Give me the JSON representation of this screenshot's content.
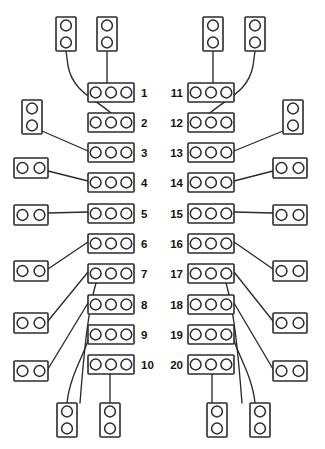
{
  "diagram": {
    "type": "connector-pinout",
    "canvas": {
      "width": 325,
      "height": 449
    },
    "colors": {
      "background": "#ffffff",
      "stroke": "#2b2b2b",
      "label": "#141414",
      "fill": "#ffffff"
    },
    "geometry": {
      "hole_radius": 5.4,
      "block_stroke_width": 1.6,
      "lead_stroke_width": 1.35,
      "row_pitch": 30.2,
      "first_row_top": 83,
      "block3_width": 46,
      "block3_height": 19,
      "block2h_width": 34,
      "block2h_height": 20,
      "block2v_width": 20,
      "block2v_height": 34
    },
    "columns": {
      "left": {
        "name": "left-terminal-column",
        "block_x": 88,
        "label_x": 141,
        "label_align": "start"
      },
      "right": {
        "name": "right-terminal-column",
        "block_x": 188,
        "label_x": 183,
        "label_align": "end"
      }
    },
    "terminal_rows": {
      "left": [
        {
          "label": "1",
          "y": 83
        },
        {
          "label": "2",
          "y": 113
        },
        {
          "label": "3",
          "y": 143
        },
        {
          "label": "4",
          "y": 173
        },
        {
          "label": "5",
          "y": 204
        },
        {
          "label": "6",
          "y": 234
        },
        {
          "label": "7",
          "y": 264
        },
        {
          "label": "8",
          "y": 295
        },
        {
          "label": "9",
          "y": 325
        },
        {
          "label": "10",
          "y": 355
        }
      ],
      "right": [
        {
          "label": "11",
          "y": 83
        },
        {
          "label": "12",
          "y": 113
        },
        {
          "label": "13",
          "y": 143
        },
        {
          "label": "14",
          "y": 173
        },
        {
          "label": "15",
          "y": 204
        },
        {
          "label": "16",
          "y": 234
        },
        {
          "label": "17",
          "y": 264
        },
        {
          "label": "18",
          "y": 295
        },
        {
          "label": "19",
          "y": 325
        },
        {
          "label": "20",
          "y": 355
        }
      ]
    },
    "connectors": [
      {
        "name": "connector-top-left-a",
        "shape": "2-vertical",
        "x": 56,
        "y": 17
      },
      {
        "name": "connector-top-left-b",
        "shape": "2-vertical",
        "x": 97,
        "y": 17
      },
      {
        "name": "connector-top-right-a",
        "shape": "2-vertical",
        "x": 203,
        "y": 17
      },
      {
        "name": "connector-top-right-b",
        "shape": "2-vertical",
        "x": 245,
        "y": 17
      },
      {
        "name": "connector-left-1",
        "shape": "2-vertical",
        "x": 22,
        "y": 100
      },
      {
        "name": "connector-left-2",
        "shape": "2-horizontal",
        "x": 14,
        "y": 158
      },
      {
        "name": "connector-left-3",
        "shape": "2-horizontal",
        "x": 14,
        "y": 205
      },
      {
        "name": "connector-left-4",
        "shape": "2-horizontal",
        "x": 14,
        "y": 261
      },
      {
        "name": "connector-left-5",
        "shape": "2-horizontal",
        "x": 14,
        "y": 313
      },
      {
        "name": "connector-left-6",
        "shape": "2-horizontal",
        "x": 14,
        "y": 361
      },
      {
        "name": "connector-right-1",
        "shape": "2-vertical",
        "x": 283,
        "y": 100
      },
      {
        "name": "connector-right-2",
        "shape": "2-horizontal",
        "x": 273,
        "y": 158
      },
      {
        "name": "connector-right-3",
        "shape": "2-horizontal",
        "x": 273,
        "y": 205
      },
      {
        "name": "connector-right-4",
        "shape": "2-horizontal",
        "x": 273,
        "y": 261
      },
      {
        "name": "connector-right-5",
        "shape": "2-horizontal",
        "x": 273,
        "y": 313
      },
      {
        "name": "connector-right-6",
        "shape": "2-horizontal",
        "x": 273,
        "y": 361
      },
      {
        "name": "connector-bottom-left-a",
        "shape": "2-vertical",
        "x": 57,
        "y": 403
      },
      {
        "name": "connector-bottom-left-b",
        "shape": "2-vertical",
        "x": 100,
        "y": 403
      },
      {
        "name": "connector-bottom-right-a",
        "shape": "2-vertical",
        "x": 207,
        "y": 403
      },
      {
        "name": "connector-bottom-right-b",
        "shape": "2-vertical",
        "x": 250,
        "y": 403
      }
    ],
    "leads": [
      {
        "name": "lead-top-left-a-to-row-2",
        "d": "M 66 51 L 68 66 C 73 92 94 98 111 113"
      },
      {
        "name": "lead-top-left-b-to-row-1",
        "d": "M 107 51 L 107 83"
      },
      {
        "name": "lead-top-right-b-to-row-12",
        "d": "M 255 51 L 253 66 C 248 92 227 98 210 113"
      },
      {
        "name": "lead-top-right-a-to-row-11",
        "d": "M 213 51 L 213 83"
      },
      {
        "name": "lead-left-1-to-row-3",
        "d": "M 42 131 L 88 151"
      },
      {
        "name": "lead-left-2-to-row-4",
        "d": "M 48 171 L 88 181"
      },
      {
        "name": "lead-left-3-to-row-5",
        "d": "M 48 213 L 88 212"
      },
      {
        "name": "lead-left-4-to-row-6",
        "d": "M 48 269 L 88 242"
      },
      {
        "name": "lead-left-5-to-row-7",
        "d": "M 48 321 L 88 272"
      },
      {
        "name": "lead-left-6-to-row-8",
        "d": "M 48 369 L 88 303"
      },
      {
        "name": "lead-right-1-to-row-13",
        "d": "M 283 131 L 234 151"
      },
      {
        "name": "lead-right-2-to-row-14",
        "d": "M 273 171 L 234 181"
      },
      {
        "name": "lead-right-3-to-row-15",
        "d": "M 273 213 L 234 212"
      },
      {
        "name": "lead-right-4-to-row-16",
        "d": "M 273 269 L 234 242"
      },
      {
        "name": "lead-right-5-to-row-17",
        "d": "M 273 321 L 234 272"
      },
      {
        "name": "lead-right-6-to-row-18",
        "d": "M 273 369 L 234 303"
      },
      {
        "name": "lead-row-9-to-bottom-left-a",
        "d": "M 90 334 C 86 352 70 374 67 403"
      },
      {
        "name": "lead-row-10-to-bottom-left-b",
        "d": "M 110 374 L 110 403"
      },
      {
        "name": "lead-row-19-to-bottom-right-a",
        "d": "M 232 334 C 236 352 252 374 255 403"
      },
      {
        "name": "lead-row-20-to-bottom-right-b",
        "d": "M 212 374 L 212 403"
      },
      {
        "name": "lead-row-7-curve-down",
        "d": "M 96 283 C 88 310 84 352 80 403"
      },
      {
        "name": "lead-row-17-curve-down",
        "d": "M 226 283 C 234 310 238 352 242 403"
      }
    ]
  }
}
